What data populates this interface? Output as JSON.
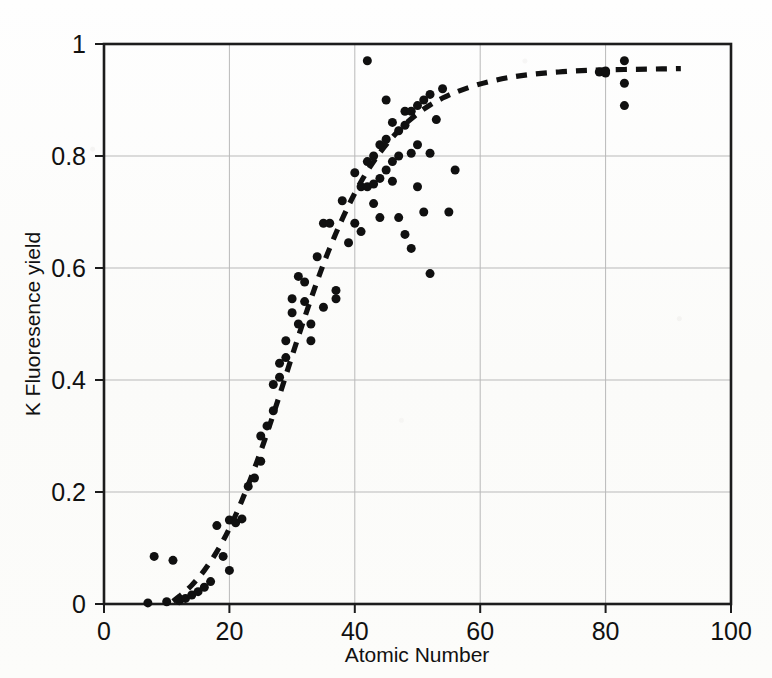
{
  "figure": {
    "background_color": "#fdfdfc",
    "ink_color": "#101010",
    "grid_color": "#b9b9b9"
  },
  "axes": {
    "x_title": "Atomic Number",
    "y_title": "K Fluoresence yield",
    "x_ticks": [
      "0",
      "20",
      "40",
      "60",
      "80",
      "100"
    ],
    "y_ticks": [
      "0",
      "0.2",
      "0.4",
      "0.6",
      "0.8",
      "1"
    ]
  },
  "chart_data": {
    "type": "scatter",
    "title": "",
    "xlabel": "Atomic Number",
    "ylabel": "K Fluoresence yield",
    "xlim": [
      0,
      100
    ],
    "ylim": [
      0,
      1
    ],
    "xticks": [
      0,
      20,
      40,
      60,
      80,
      100
    ],
    "yticks": [
      0,
      0.2,
      0.4,
      0.6,
      0.8,
      1
    ],
    "grid": true,
    "legend": "none",
    "marker": {
      "shape": "circle",
      "filled": true,
      "color": "#101010",
      "size_px": 9
    },
    "series": [
      {
        "name": "Measured K fluorescence yield",
        "type": "scatter",
        "points": [
          [
            7,
            0.002
          ],
          [
            8,
            0.085
          ],
          [
            10,
            0.004
          ],
          [
            11,
            0.078
          ],
          [
            12,
            0.006
          ],
          [
            13,
            0.01
          ],
          [
            14,
            0.016
          ],
          [
            15,
            0.022
          ],
          [
            16,
            0.03
          ],
          [
            17,
            0.04
          ],
          [
            18,
            0.14
          ],
          [
            19,
            0.085
          ],
          [
            20,
            0.15
          ],
          [
            20,
            0.06
          ],
          [
            21,
            0.145
          ],
          [
            22,
            0.152
          ],
          [
            23,
            0.21
          ],
          [
            24,
            0.225
          ],
          [
            25,
            0.255
          ],
          [
            25,
            0.3
          ],
          [
            26,
            0.318
          ],
          [
            27,
            0.345
          ],
          [
            27,
            0.392
          ],
          [
            28,
            0.405
          ],
          [
            28,
            0.43
          ],
          [
            29,
            0.44
          ],
          [
            29,
            0.47
          ],
          [
            30,
            0.52
          ],
          [
            30,
            0.545
          ],
          [
            31,
            0.5
          ],
          [
            31,
            0.585
          ],
          [
            32,
            0.54
          ],
          [
            32,
            0.575
          ],
          [
            33,
            0.5
          ],
          [
            33,
            0.47
          ],
          [
            34,
            0.62
          ],
          [
            35,
            0.53
          ],
          [
            35,
            0.68
          ],
          [
            36,
            0.68
          ],
          [
            37,
            0.56
          ],
          [
            37,
            0.545
          ],
          [
            38,
            0.72
          ],
          [
            39,
            0.645
          ],
          [
            40,
            0.68
          ],
          [
            40,
            0.77
          ],
          [
            41,
            0.665
          ],
          [
            41,
            0.745
          ],
          [
            42,
            0.79
          ],
          [
            42,
            0.97
          ],
          [
            42,
            0.745
          ],
          [
            43,
            0.75
          ],
          [
            43,
            0.8
          ],
          [
            43,
            0.715
          ],
          [
            44,
            0.69
          ],
          [
            44,
            0.82
          ],
          [
            44,
            0.76
          ],
          [
            45,
            0.9
          ],
          [
            45,
            0.83
          ],
          [
            45,
            0.775
          ],
          [
            46,
            0.86
          ],
          [
            46,
            0.79
          ],
          [
            46,
            0.755
          ],
          [
            47,
            0.845
          ],
          [
            47,
            0.8
          ],
          [
            47,
            0.69
          ],
          [
            48,
            0.88
          ],
          [
            48,
            0.855
          ],
          [
            48,
            0.66
          ],
          [
            49,
            0.88
          ],
          [
            49,
            0.805
          ],
          [
            49,
            0.635
          ],
          [
            50,
            0.89
          ],
          [
            50,
            0.82
          ],
          [
            50,
            0.745
          ],
          [
            51,
            0.9
          ],
          [
            51,
            0.7
          ],
          [
            52,
            0.91
          ],
          [
            52,
            0.805
          ],
          [
            52,
            0.59
          ],
          [
            53,
            0.865
          ],
          [
            54,
            0.92
          ],
          [
            55,
            0.7
          ],
          [
            56,
            0.775
          ],
          [
            79,
            0.95
          ],
          [
            80,
            0.948
          ],
          [
            80,
            0.952
          ],
          [
            83,
            0.97
          ],
          [
            83,
            0.93
          ],
          [
            83,
            0.89
          ]
        ]
      },
      {
        "name": "Fitted curve",
        "type": "line",
        "style": "dashed",
        "x_range": [
          11,
          92
        ],
        "points": [
          [
            11,
            0.005
          ],
          [
            13,
            0.022
          ],
          [
            15,
            0.045
          ],
          [
            17,
            0.075
          ],
          [
            19,
            0.112
          ],
          [
            21,
            0.158
          ],
          [
            23,
            0.212
          ],
          [
            25,
            0.272
          ],
          [
            27,
            0.338
          ],
          [
            29,
            0.408
          ],
          [
            31,
            0.478
          ],
          [
            33,
            0.545
          ],
          [
            35,
            0.608
          ],
          [
            37,
            0.663
          ],
          [
            39,
            0.712
          ],
          [
            41,
            0.755
          ],
          [
            43,
            0.791
          ],
          [
            45,
            0.821
          ],
          [
            47,
            0.846
          ],
          [
            49,
            0.867
          ],
          [
            51,
            0.884
          ],
          [
            53,
            0.898
          ],
          [
            55,
            0.909
          ],
          [
            57,
            0.918
          ],
          [
            60,
            0.929
          ],
          [
            63,
            0.937
          ],
          [
            66,
            0.943
          ],
          [
            70,
            0.948
          ],
          [
            75,
            0.952
          ],
          [
            80,
            0.954
          ],
          [
            86,
            0.955
          ],
          [
            92,
            0.956
          ]
        ]
      }
    ]
  }
}
